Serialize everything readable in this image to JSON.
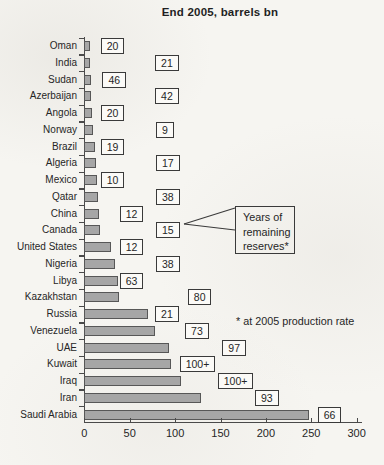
{
  "title": "End 2005, barrels bn",
  "colors": {
    "background": "#f6f5f1",
    "bar_fill": "#a6a6a6",
    "bar_border": "#575757",
    "box_bg": "#fbfaf7",
    "axis": "#4a4a4a",
    "text": "#262626"
  },
  "chart_data": {
    "type": "bar",
    "orientation": "horizontal",
    "title": "End 2005, barrels bn",
    "categories": [
      "Oman",
      "India",
      "Sudan",
      "Azerbaijan",
      "Angola",
      "Norway",
      "Brazil",
      "Algeria",
      "Mexico",
      "Qatar",
      "China",
      "Canada",
      "United States",
      "Nigeria",
      "Libya",
      "Kazakhstan",
      "Russia",
      "Venezuela",
      "UAE",
      "Kuwait",
      "Iraq",
      "Iran",
      "Saudi Arabia"
    ],
    "values": [
      6,
      6,
      7,
      7,
      9,
      10,
      12,
      13,
      14,
      15,
      16,
      17,
      29,
      34,
      37,
      38,
      70,
      78,
      93,
      95,
      106,
      128,
      248
    ],
    "values_note": "proved oil reserves, barrels bn, estimated from bar lengths",
    "years_labels": [
      "20",
      "21",
      "46",
      "42",
      "20",
      "9",
      "19",
      "17",
      "10",
      "38",
      "12",
      "15",
      "12",
      "38",
      "63",
      "80",
      "21",
      "73",
      "97",
      "100+",
      "100+",
      "93",
      "66"
    ],
    "years_box_x_units": [
      18,
      78,
      20,
      78,
      18,
      79,
      18,
      79,
      18,
      79,
      39,
      79,
      39,
      79,
      39,
      114,
      78,
      111,
      152,
      105,
      147,
      188,
      257
    ],
    "xlim": [
      0,
      300
    ],
    "x_ticks": [
      "0",
      "50",
      "100",
      "150",
      "200",
      "250",
      "300"
    ],
    "grid": false,
    "legend": "none",
    "callout": {
      "lines": [
        "Years of",
        "remaining",
        "reserves*"
      ]
    },
    "footnote": "* at 2005 production rate"
  }
}
